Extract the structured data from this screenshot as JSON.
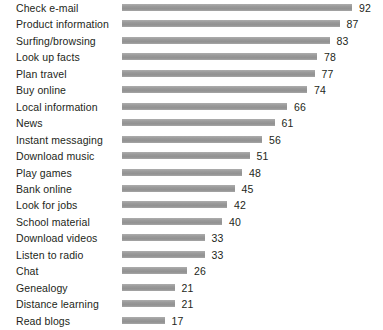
{
  "chart_data": {
    "type": "bar",
    "orientation": "horizontal",
    "title": "",
    "subtitle": "",
    "xlabel": "",
    "ylabel": "",
    "grid": false,
    "legend": null,
    "xlim": [
      0,
      92
    ],
    "categories": [
      "Check e-mail",
      "Product information",
      "Surfing/browsing",
      "Look up facts",
      "Plan travel",
      "Buy online",
      "Local information",
      "News",
      "Instant messaging",
      "Download music",
      "Play games",
      "Bank online",
      "Look for jobs",
      "School material",
      "Download videos",
      "Listen to radio",
      "Chat",
      "Genealogy",
      "Distance learning",
      "Read blogs"
    ],
    "values": [
      92,
      87,
      83,
      78,
      77,
      74,
      66,
      61,
      56,
      51,
      48,
      45,
      42,
      40,
      33,
      33,
      26,
      21,
      21,
      17
    ],
    "value_labels": [
      "92",
      "87",
      "83",
      "78",
      "77",
      "74",
      "66",
      "61",
      "56",
      "51",
      "48",
      "45",
      "42",
      "40",
      "33",
      "33",
      "26",
      "21",
      "21",
      "17"
    ],
    "bar_color": "#9c9c9c",
    "text_color": "#231f20",
    "background_color": "#ffffff"
  }
}
